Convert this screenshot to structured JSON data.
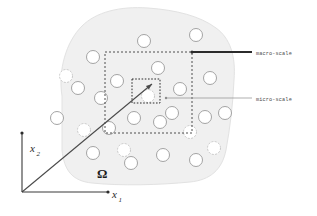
{
  "figure": {
    "background_color": "#ffffff",
    "width": 317,
    "height": 216
  },
  "domain_region": {
    "label": "Ω",
    "label_x": 97,
    "label_y": 178,
    "fill_color": "#f0f0f0",
    "stroke_color": "#e2e2e2",
    "outline_path": "M 62,96 C 58,70 66,42 82,26 C 96,12 120,6 148,8 C 176,10 200,16 216,28 C 230,38 236,56 234,80 C 233,104 230,128 226,150 C 222,170 210,180 190,182 C 160,185 120,186 92,183 C 72,181 64,170 62,150 Z"
  },
  "axes": {
    "origin": {
      "x": 22,
      "y": 192
    },
    "x_axis": {
      "label": "x",
      "subscript": "1",
      "end_x": 108,
      "end_y": 192,
      "label_x": 112,
      "label_y": 198
    },
    "y_axis": {
      "label": "x",
      "subscript": "2",
      "end_x": 22,
      "end_y": 133,
      "label_x": 30,
      "label_y": 152
    },
    "stroke_color": "#3a3a3a"
  },
  "pointer_line": {
    "description": "diagonal arrow from origin into micro-scale box",
    "from_x": 22,
    "from_y": 192,
    "to_x": 152,
    "to_y": 84,
    "stroke_color": "#4a4a4a"
  },
  "macro_box": {
    "name": "macro-scale",
    "x": 105,
    "y": 52,
    "width": 87,
    "height": 81,
    "stroke_color": "#3a3a3a",
    "dash": "2,2"
  },
  "micro_box": {
    "name": "micro-scale",
    "x": 132,
    "y": 79,
    "width": 28,
    "height": 24,
    "stroke_color": "#2b2b2b",
    "dash": "1.6,1.6"
  },
  "callouts": [
    {
      "id": "macro-scale",
      "label": "macro-scale",
      "leader_from_x": 192,
      "leader_from_y": 52,
      "leader_to_x": 252,
      "leader_to_y": 52,
      "text_x": 256,
      "text_y": 54,
      "thick": true,
      "stroke_color": "#2b2b2b"
    },
    {
      "id": "micro-scale",
      "label": "micro-scale",
      "leader_from_x": 166,
      "leader_from_y": 98,
      "leader_to_x": 252,
      "leader_to_y": 98,
      "text_x": 256,
      "text_y": 100,
      "thick": false,
      "stroke_color": "#8c8c8c"
    }
  ],
  "inclusions": {
    "description": "circular inclusions (pores / fibers) distributed in the domain",
    "count": 26,
    "stroke_color": "#9a9a9a",
    "fill_color": "#ffffff",
    "items": [
      {
        "cx": 144,
        "cy": 41,
        "r": 6.5
      },
      {
        "cx": 196,
        "cy": 35,
        "r": 6.5
      },
      {
        "cx": 93,
        "cy": 57,
        "r": 6.5
      },
      {
        "cx": 158,
        "cy": 68,
        "r": 6.5
      },
      {
        "cx": 117,
        "cy": 81,
        "r": 6.5
      },
      {
        "cx": 78,
        "cy": 88,
        "r": 6.5
      },
      {
        "cx": 210,
        "cy": 78,
        "r": 6.5
      },
      {
        "cx": 180,
        "cy": 89,
        "r": 6.5
      },
      {
        "cx": 57,
        "cy": 118,
        "r": 6.5
      },
      {
        "cx": 134,
        "cy": 118,
        "r": 6.5
      },
      {
        "cx": 160,
        "cy": 122,
        "r": 6.5
      },
      {
        "cx": 205,
        "cy": 117,
        "r": 6.5
      },
      {
        "cx": 109,
        "cy": 128,
        "r": 6.5
      },
      {
        "cx": 93,
        "cy": 153,
        "r": 6.5
      },
      {
        "cx": 131,
        "cy": 163,
        "r": 6.5
      },
      {
        "cx": 163,
        "cy": 155,
        "r": 6.5
      },
      {
        "cx": 196,
        "cy": 160,
        "r": 6.5
      },
      {
        "cx": 225,
        "cy": 113,
        "r": 6.5
      },
      {
        "cx": 101,
        "cy": 98,
        "r": 6.5
      },
      {
        "cx": 172,
        "cy": 113,
        "r": 6.5
      }
    ]
  }
}
